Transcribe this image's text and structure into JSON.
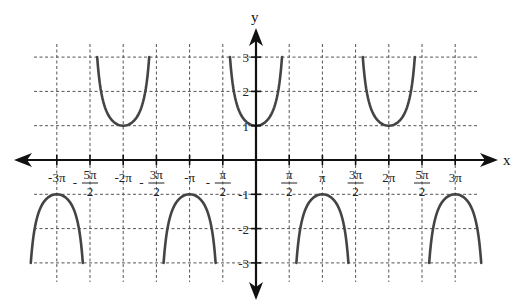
{
  "chart_data": {
    "type": "line",
    "title": "",
    "function": "y = sec(x)",
    "xlabel": "x",
    "ylabel": "y",
    "xlim_radians": [
      -3.2,
      3.2
    ],
    "ylim": [
      -3,
      3
    ],
    "grid": true,
    "grid_style": "dashed",
    "x_ticks": [
      {
        "value": -3.0,
        "label": "-3π"
      },
      {
        "value": -2.5,
        "label": "-5π/2"
      },
      {
        "value": -2.0,
        "label": "-2π"
      },
      {
        "value": -1.5,
        "label": "-3π/2"
      },
      {
        "value": -1.0,
        "label": "-π"
      },
      {
        "value": -0.5,
        "label": "-π/2"
      },
      {
        "value": 0.5,
        "label": "π/2"
      },
      {
        "value": 1.0,
        "label": "π"
      },
      {
        "value": 1.5,
        "label": "3π/2"
      },
      {
        "value": 2.0,
        "label": "2π"
      },
      {
        "value": 2.5,
        "label": "5π/2"
      },
      {
        "value": 3.0,
        "label": "3π"
      }
    ],
    "y_ticks": [
      {
        "value": 3,
        "label": "3"
      },
      {
        "value": 2,
        "label": "2"
      },
      {
        "value": 1,
        "label": "1"
      },
      {
        "value": -1,
        "label": "-1"
      },
      {
        "value": -2,
        "label": "-2"
      },
      {
        "value": -3,
        "label": "-3"
      }
    ],
    "series": [
      {
        "name": "branch-up-neg2pi",
        "vertex": [
          -2.0,
          1
        ],
        "range_pi": [
          -2.5,
          -1.5
        ],
        "direction": "up"
      },
      {
        "name": "branch-up-0",
        "vertex": [
          0.0,
          1
        ],
        "range_pi": [
          -0.5,
          0.5
        ],
        "direction": "up"
      },
      {
        "name": "branch-up-2pi",
        "vertex": [
          2.0,
          1
        ],
        "range_pi": [
          1.5,
          2.5
        ],
        "direction": "up"
      },
      {
        "name": "branch-down-neg3pi",
        "vertex": [
          -3.0,
          -1
        ],
        "range_pi": [
          -3.5,
          -2.5
        ],
        "direction": "down"
      },
      {
        "name": "branch-down-negpi",
        "vertex": [
          -1.0,
          -1
        ],
        "range_pi": [
          -1.5,
          -0.5
        ],
        "direction": "down"
      },
      {
        "name": "branch-down-pi",
        "vertex": [
          1.0,
          -1
        ],
        "range_pi": [
          0.5,
          1.5
        ],
        "direction": "down"
      },
      {
        "name": "branch-down-3pi",
        "vertex": [
          3.0,
          -1
        ],
        "range_pi": [
          2.5,
          3.5
        ],
        "direction": "down"
      }
    ],
    "colors": {
      "curve": "#444444",
      "axis": "#111111",
      "grid": "#555555"
    }
  }
}
